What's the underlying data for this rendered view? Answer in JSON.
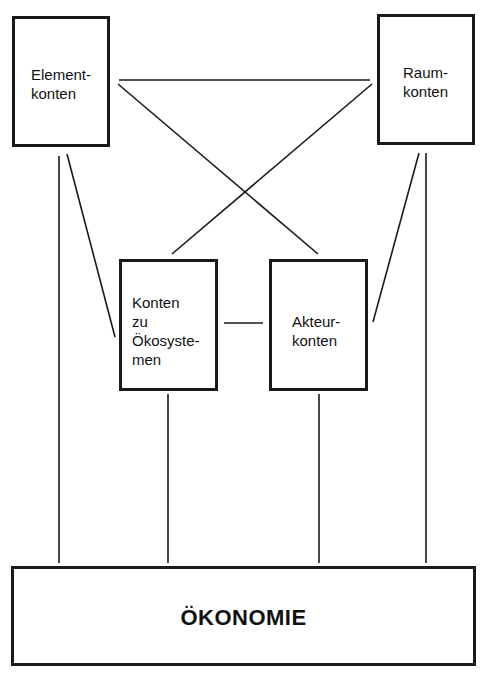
{
  "diagram": {
    "nodes": {
      "element": {
        "label": "Element-\nkonten"
      },
      "raum": {
        "label": "Raum-\nkonten"
      },
      "oekosysteme": {
        "label": "Konten\nzu\nÖkosyste-\nmen"
      },
      "akteur": {
        "label": "Akteur-\nkonten"
      },
      "oekonomie": {
        "label": "ÖKONOMIE"
      }
    },
    "edges": [
      {
        "from": "element",
        "to": "raum"
      },
      {
        "from": "element",
        "to": "akteur"
      },
      {
        "from": "raum",
        "to": "oekosysteme"
      },
      {
        "from": "element",
        "to": "oekosysteme"
      },
      {
        "from": "raum",
        "to": "akteur"
      },
      {
        "from": "oekosysteme",
        "to": "akteur"
      },
      {
        "from": "element",
        "to": "oekonomie"
      },
      {
        "from": "raum",
        "to": "oekonomie"
      },
      {
        "from": "oekosysteme",
        "to": "oekonomie"
      },
      {
        "from": "akteur",
        "to": "oekonomie"
      }
    ],
    "line_color": "#1a1a1a"
  }
}
